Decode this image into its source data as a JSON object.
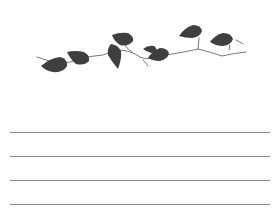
{
  "page": {
    "type": "lined-notepad",
    "background": "#ffffff"
  },
  "decoration": {
    "name": "ivy-vine",
    "leaf_color": "#3f3f3f",
    "stem_color": "#6a6a6a",
    "leaf_count": 8
  },
  "lines": {
    "color": "#8a8a8a",
    "count": 4,
    "positions_y": [
      132,
      156,
      180,
      204
    ]
  }
}
